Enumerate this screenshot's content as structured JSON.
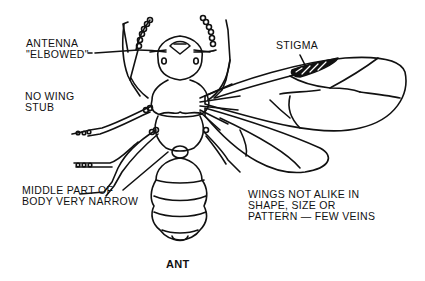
{
  "diagram": {
    "title": "ANT",
    "labels": {
      "antenna": [
        "ANTENNA",
        "\"ELBOWED\""
      ],
      "no_wing_stub": [
        "NO WING",
        "STUB"
      ],
      "stigma": [
        "STIGMA"
      ],
      "middle_body": [
        "MIDDLE PART OF",
        "BODY VERY NARROW"
      ],
      "wings": [
        "WINGS NOT ALIKE IN",
        "SHAPE, SIZE OR",
        "PATTERN — FEW VEINS"
      ]
    },
    "colors": {
      "line": "#111111",
      "background": "#ffffff"
    }
  }
}
